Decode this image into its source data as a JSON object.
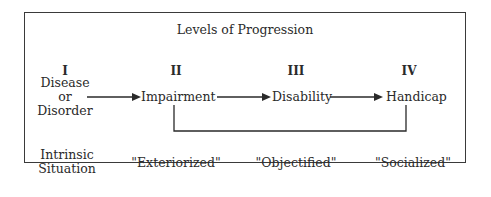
{
  "title": "Levels of Progression",
  "levels": [
    {
      "numeral": "I",
      "term_lines": [
        "Disease",
        "or",
        "Disorder"
      ],
      "descriptor_lines": [
        "Intrinsic",
        "Situation"
      ]
    },
    {
      "numeral": "II",
      "term": "Impairment",
      "descriptor": "\"Exteriorized\""
    },
    {
      "numeral": "III",
      "term": "Disability",
      "descriptor": "\"Objectified\""
    },
    {
      "numeral": "IV",
      "term": "Handicap",
      "descriptor": "\"Socialized\""
    }
  ],
  "connections": [
    {
      "from": "Disease or Disorder",
      "to": "Impairment",
      "type": "arrow"
    },
    {
      "from": "Impairment",
      "to": "Disability",
      "type": "arrow"
    },
    {
      "from": "Disability",
      "to": "Handicap",
      "type": "arrow"
    },
    {
      "from": "Impairment",
      "to": "Handicap",
      "type": "bracket-line"
    }
  ]
}
